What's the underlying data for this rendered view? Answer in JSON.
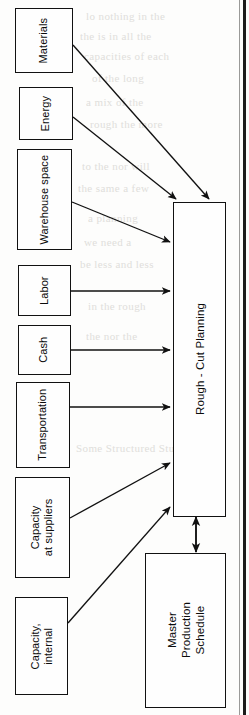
{
  "figure": {
    "type": "flow-diagram",
    "orientation": "rotated-90-ccw"
  },
  "inputs": [
    {
      "id": "materials",
      "label": "Materials"
    },
    {
      "id": "energy",
      "label": "Energy"
    },
    {
      "id": "warehouse-space",
      "label": "Warehouse space"
    },
    {
      "id": "labor",
      "label": "Labor"
    },
    {
      "id": "cash",
      "label": "Cash"
    },
    {
      "id": "transportation",
      "label": "Transportation"
    },
    {
      "id": "capacity-suppliers",
      "line1": "Capacity",
      "line2": "at suppliers"
    },
    {
      "id": "capacity-internal",
      "line1": "Capacity,",
      "line2": "internal"
    }
  ],
  "process": {
    "id": "rough-cut-planning",
    "label": "Rough - Cut Planning"
  },
  "schedule": {
    "id": "master-production-schedule",
    "line1": "Master",
    "line2": "Production",
    "line3": "Schedule"
  },
  "colors": {
    "ink": "#111111",
    "paper": "#fdfdfc",
    "edge": "#1c1c1c",
    "bleed": "#c8c6c2"
  },
  "bleedthrough": [
    {
      "text": "lo nothing in the"
    },
    {
      "text": "the is in all the"
    },
    {
      "text": "capacities of each"
    },
    {
      "text": "of the long"
    },
    {
      "text": "a mix of the"
    },
    {
      "text": "rough the more"
    },
    {
      "text": "to the nor will"
    },
    {
      "text": "the same a few"
    },
    {
      "text": "a planning"
    },
    {
      "text": "we need a"
    },
    {
      "text": "be less and less"
    },
    {
      "text": "in the rough"
    },
    {
      "text": "the nor the"
    },
    {
      "text": "Some Structured Stuff"
    }
  ]
}
